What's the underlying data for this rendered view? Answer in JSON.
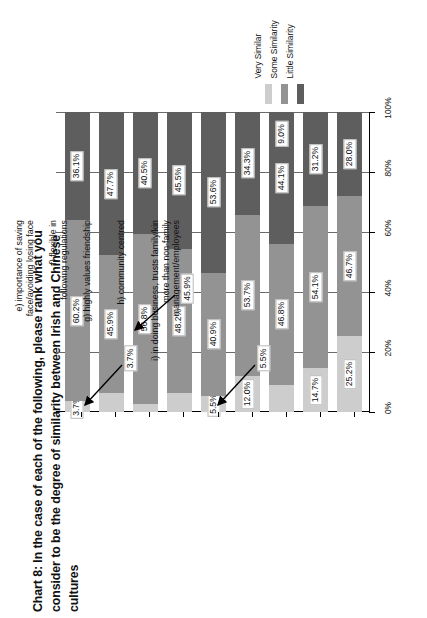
{
  "title": "Chart 8: In the case of each of the following, please rank what you consider to be the degree of similarity between Irish and Chinese cultures",
  "legend": {
    "position": "top-right-rotated",
    "items": [
      {
        "label": "Very Similar",
        "color": "#cdcdcd"
      },
      {
        "label": "Some Similarity",
        "color": "#939393"
      },
      {
        "label": "Little Similarity",
        "color": "#5e5e5e"
      }
    ]
  },
  "axis": {
    "ticks": [
      "0%",
      "20%",
      "40%",
      "60%",
      "80%",
      "100%"
    ],
    "values": [
      0,
      20,
      40,
      60,
      80,
      100
    ]
  },
  "annotations": [
    {
      "text": "3.7%",
      "points_to": "a-very-similar"
    },
    {
      "text": "45.9%",
      "points_to": "b-some-similarity"
    },
    {
      "text": "5.5%",
      "points_to": "e-very-similar"
    }
  ],
  "chart_data": {
    "type": "bar",
    "title": "Chart 8: In the case of each of the following, please rank what you consider to be the degree of similarity between Irish and Chinese cultures",
    "subtitle": "",
    "orientation": "vertical-stacked-100pct",
    "xlabel": "",
    "ylabel": "",
    "ylim": [
      0,
      100
    ],
    "grid": true,
    "legend_position": "top right",
    "categories": [
      "a) respects/obeys authority",
      "b) focus on family values",
      "c) do business through personal connections",
      "d) use long-term relationships to establish mutual trust",
      "e) importance of saving face/avoiding losing face",
      "f) flexible in following regulations",
      "g) highly values friendship",
      "h) community centred",
      "i) in doing business, trusts family/kin more than non-family management/employees"
    ],
    "series": [
      {
        "name": "Very Similar",
        "color": "#cdcdcd",
        "values": [
          3.7,
          6.4,
          2.7,
          6.3,
          5.5,
          12.0,
          9.1,
          14.7,
          25.2
        ]
      },
      {
        "name": "Some Similarity",
        "color": "#939393",
        "values": [
          60.2,
          45.9,
          56.8,
          48.2,
          40.9,
          53.7,
          46.8,
          54.1,
          46.7
        ]
      },
      {
        "name": "Little Similarity",
        "color": "#5e5e5e",
        "values": [
          36.1,
          47.7,
          40.5,
          45.5,
          53.6,
          34.3,
          44.1,
          31.2,
          28.0
        ]
      }
    ],
    "data_labels": [
      {
        "category": "a) respects/obeys authority",
        "Very Similar": "3.7%",
        "Some Similarity": "60.2%",
        "Little Similarity": "36.1%"
      },
      {
        "category": "b) focus on family values",
        "Very Similar": "",
        "Some Similarity": "45.9%",
        "Little Similarity": "47.7%"
      },
      {
        "category": "c) do business through personal connections",
        "Very Similar": "",
        "Some Similarity": "56.8%",
        "Little Similarity": "40.5%"
      },
      {
        "category": "d) use long-term relationships to establish mutual trust",
        "Very Similar": "",
        "Some Similarity": "48.2%",
        "Little Similarity": "45.5%"
      },
      {
        "category": "e) importance of saving face/avoiding losing face",
        "Very Similar": "5.5%",
        "Some Similarity": "40.9%",
        "Little Similarity": "53.6%"
      },
      {
        "category": "f) flexible in following regulations",
        "Very Similar": "12.0%",
        "Some Similarity": "53.7%",
        "Little Similarity": "34.3%"
      },
      {
        "category": "g) highly values friendship",
        "Very Similar": "",
        "Some Similarity": "46.8%",
        "Little Similarity": "44.1%"
      },
      {
        "category": "h) community centred",
        "Very Similar": "14.7%",
        "Some Similarity": "54.1%",
        "Little Similarity": "31.2%"
      },
      {
        "category": "i) in doing business, trusts family/kin more than non-family management/employees",
        "Very Similar": "25.2%",
        "Some Similarity": "46.7%",
        "Little Similarity": "28.0%"
      }
    ],
    "extra_labels": [
      {
        "text": "9.0%",
        "category": "g) highly values friendship",
        "note": "appears near top of bar g"
      }
    ]
  },
  "cat_labels": [
    [
      "a) respects/obeys authority"
    ],
    [
      "b) focus on family values"
    ],
    [
      "c) do business through",
      "personal connections"
    ],
    [
      "d) use long-term relationships",
      "to establish mutual trust"
    ],
    [
      "e) importance of saving",
      "face/avoiding losing face"
    ],
    [
      "f) flexible in",
      "following regulations"
    ],
    [
      "g) highly values friendship"
    ],
    [
      "h) community centred"
    ],
    [
      "i) in doing business, trusts family/kin",
      "more than non-family",
      "management/employees"
    ]
  ]
}
